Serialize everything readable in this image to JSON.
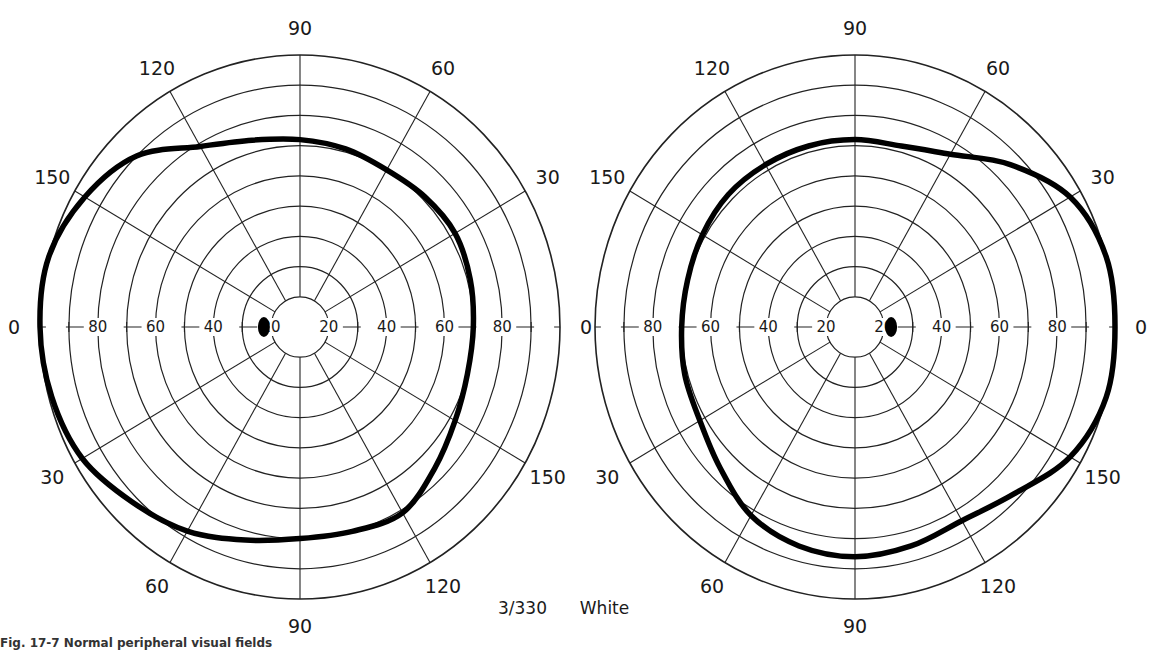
{
  "chart_data": [
    {
      "type": "polar-visual-field",
      "eye": "left-chart",
      "center_px": [
        300,
        327
      ],
      "radius_px": [
        260,
        272
      ],
      "rings_deg": [
        10,
        20,
        30,
        40,
        50,
        60,
        70,
        80,
        90
      ],
      "meridians_deg": [
        0,
        30,
        60,
        90,
        120,
        150,
        180,
        210,
        240,
        270,
        300,
        330
      ],
      "meridian_labels": {
        "90": "90",
        "60": "60",
        "30": "30",
        "0": "0",
        "330": "150",
        "300": "120",
        "270": "90",
        "240": "60",
        "210": "30",
        "180": "0",
        "150": "150",
        "120": "120"
      },
      "axis_tick_labels_left": [
        "80",
        "60",
        "40",
        "20"
      ],
      "axis_tick_labels_right": [
        "20",
        "40",
        "60",
        "80"
      ],
      "field_boundary": {
        "angles_deg": [
          0,
          15,
          30,
          45,
          60,
          75,
          90,
          105,
          120,
          135,
          150,
          165,
          180,
          195,
          210,
          225,
          240,
          255,
          270,
          285,
          300,
          315,
          330,
          345
        ],
        "radius_deg": [
          60,
          61,
          62,
          61,
          60,
          61,
          62,
          64,
          69,
          80,
          86,
          90,
          90,
          89,
          87,
          82,
          78,
          73,
          70,
          70,
          71,
          66,
          62,
          60
        ]
      },
      "blind_spot": {
        "angle_deg": 180,
        "ecc_deg": 15
      }
    },
    {
      "type": "polar-visual-field",
      "eye": "right-chart",
      "center_px": [
        855,
        327
      ],
      "radius_px": [
        260,
        272
      ],
      "rings_deg": [
        10,
        20,
        30,
        40,
        50,
        60,
        70,
        80,
        90
      ],
      "meridians_deg": [
        0,
        30,
        60,
        90,
        120,
        150,
        180,
        210,
        240,
        270,
        300,
        330
      ],
      "meridian_labels": {
        "90": "90",
        "60": "60",
        "30": "30",
        "0": "0",
        "330": "150",
        "300": "120",
        "270": "90",
        "240": "60",
        "210": "30",
        "150": "150",
        "120": "120"
      },
      "axis_tick_labels_left": [
        "80",
        "60",
        "40",
        "20"
      ],
      "axis_tick_labels_right": [
        "20",
        "40",
        "60",
        "80"
      ],
      "field_boundary": {
        "angles_deg": [
          0,
          15,
          30,
          45,
          60,
          75,
          90,
          105,
          120,
          135,
          150,
          165,
          180,
          195,
          210,
          225,
          240,
          255,
          270,
          285,
          300,
          315,
          330,
          345
        ],
        "radius_deg": [
          90,
          90,
          86,
          76,
          66,
          62,
          62,
          62,
          62,
          62,
          61,
          60,
          60,
          61,
          62,
          66,
          72,
          75,
          76,
          75,
          74,
          78,
          86,
          90
        ]
      },
      "blind_spot": {
        "angle_deg": 0,
        "ecc_deg": 15
      }
    }
  ],
  "caption": {
    "stimulus": "3/330",
    "color": "White"
  },
  "figure_caption": "Fig. 17-7  Normal peripheral visual fields"
}
